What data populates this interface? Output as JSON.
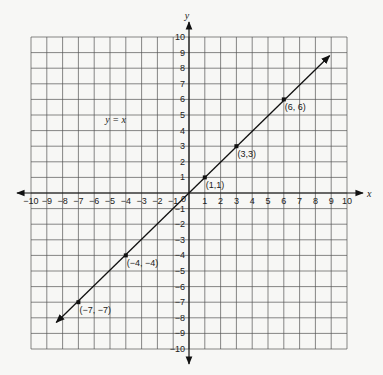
{
  "chart_data": {
    "type": "line",
    "title": "",
    "xlabel": "x",
    "ylabel": "y",
    "xlim": [
      -10,
      10
    ],
    "ylim": [
      -10,
      10
    ],
    "grid": true,
    "x_ticks": [
      -10,
      -9,
      -8,
      -7,
      -6,
      -5,
      -4,
      -3,
      -2,
      -1,
      0,
      1,
      2,
      3,
      4,
      5,
      6,
      7,
      8,
      9,
      10
    ],
    "y_ticks": [
      -10,
      -9,
      -8,
      -7,
      -6,
      -5,
      -4,
      -3,
      -2,
      -1,
      0,
      1,
      2,
      3,
      4,
      5,
      6,
      7,
      8,
      9,
      10
    ],
    "origin_label": "0",
    "series": [
      {
        "name": "y = x",
        "equation_label": "y = x",
        "line_extent": {
          "from": [
            -8.4,
            -8.3
          ],
          "to": [
            8.9,
            8.8
          ]
        },
        "points": [
          {
            "x": -7,
            "y": -7,
            "label": "(−7, −7)"
          },
          {
            "x": -4,
            "y": -4,
            "label": "(−4, −4)"
          },
          {
            "x": 1,
            "y": 1,
            "label": "(1,1)"
          },
          {
            "x": 3,
            "y": 3,
            "label": "(3,3)"
          },
          {
            "x": 6,
            "y": 6,
            "label": "(6, 6)"
          }
        ]
      }
    ],
    "annotations": [
      {
        "text": "y = x",
        "x": -5.3,
        "y": 4.5
      }
    ]
  },
  "colors": {
    "background": "#f7f7f5",
    "grid": "#555555",
    "axis": "#111111",
    "line": "#111111"
  }
}
